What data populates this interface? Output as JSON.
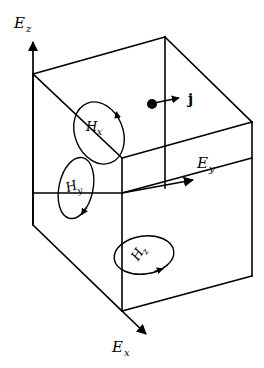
{
  "figure": {
    "kind": "3d-cube-vector-diagram",
    "background_color": "#ffffff",
    "line_color": "#000000"
  },
  "axes": [
    {
      "id": "z",
      "symbol": "E",
      "subscript": "z",
      "label": "Ez",
      "direction": "up",
      "label_x": 14,
      "label_y": 28,
      "sub_dx": 12,
      "sub_dy": 4
    },
    {
      "id": "y",
      "symbol": "E",
      "subscript": "y",
      "label": "Ey",
      "direction": "right",
      "label_x": 197,
      "label_y": 168,
      "sub_dx": 12,
      "sub_dy": 4
    },
    {
      "id": "x",
      "symbol": "E",
      "subscript": "x",
      "label": "Ex",
      "direction": "down-right (toward viewer)",
      "label_x": 112,
      "label_y": 352,
      "sub_dx": 12,
      "sub_dy": 4
    }
  ],
  "field_loops": [
    {
      "id": "Hx",
      "symbol": "H",
      "subscript": "x",
      "label": "Hx",
      "plane": "yz-face",
      "rotation_deg": -22,
      "cx": 99,
      "cy": 133,
      "rx": 24,
      "ry": 32,
      "label_x": 86,
      "label_y": 131,
      "sub_dx": 11,
      "sub_dy": 4,
      "arrow_position": "right side, pointing up"
    },
    {
      "id": "Hy",
      "symbol": "H",
      "subscript": "y",
      "label": "Hy",
      "plane": "xz-face",
      "rotation_deg": 12,
      "cx": 76,
      "cy": 188,
      "rx": 17,
      "ry": 31,
      "label_x": 67,
      "label_y": 191,
      "sub_dx": 10,
      "sub_dy": 5,
      "arrow_position": "bottom right, pointing down-right"
    },
    {
      "id": "Hz",
      "symbol": "H",
      "subscript": "z",
      "label": "Hz",
      "plane": "xy-face",
      "rotation_deg": -8,
      "cx": 144,
      "cy": 255,
      "rx": 30,
      "ry": 19,
      "label_x": 136,
      "label_y": 256,
      "sub_dx": 10,
      "sub_dy": 4,
      "arrow_position": "bottom right, pointing right"
    }
  ],
  "current_vector": {
    "id": "j",
    "label": "j",
    "style": "bold upright",
    "dot_x": 152,
    "dot_y": 104,
    "dot_r": 5,
    "tip_x": 181,
    "tip_y": 98,
    "label_x": 188,
    "label_y": 104
  },
  "cube": {
    "projection": "oblique",
    "vertices": {
      "back_top_left": [
        33,
        74
      ],
      "back_top_right": [
        165,
        37
      ],
      "front_top_right": [
        252,
        122
      ],
      "front_top_left": [
        122,
        158
      ],
      "back_bottom_left": [
        33,
        225
      ],
      "front_bottom_left": [
        122,
        311
      ],
      "front_bottom_right": [
        252,
        276
      ],
      "inner_vertex": [
        122,
        193
      ]
    }
  }
}
